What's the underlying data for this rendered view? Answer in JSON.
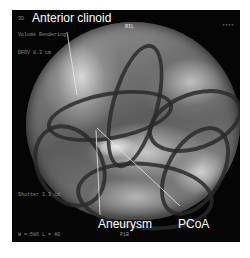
{
  "image": {
    "description": "3D volume rendering of cerebral vasculature with annotations",
    "background_color": "#050505",
    "annotations": {
      "anterior_clinoid": "Anterior clinoid",
      "aneurysm": "Aneurysm",
      "pcoa": "PCoA"
    },
    "overlay_text": {
      "top_left_mode": "3D",
      "orientation": "RIL",
      "render_mode": "Volume Rendering",
      "dfov": "DFOV 8.3 cm",
      "shutter": "Shutter 3.3 cd",
      "window_level": "W = 586 L = 40",
      "bottom_center": "P1B",
      "top_right": "****"
    }
  }
}
